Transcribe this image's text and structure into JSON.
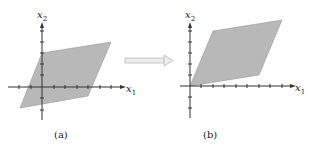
{
  "figure": {
    "arrow_color": "#c8c8c8",
    "fill_color": "#b8b8b8",
    "panels": [
      {
        "id": "a",
        "caption": "(a)",
        "x_label": "x",
        "x_sub": "1",
        "y_label": "x",
        "y_sub": "2",
        "origin": [
          42,
          87
        ],
        "polygon": "20,108 88,96 111,42 42,53"
      },
      {
        "id": "b",
        "caption": "(b)",
        "x_label": "x",
        "x_sub": "1",
        "y_label": "x",
        "y_sub": "2",
        "origin": [
          190,
          86
        ],
        "polygon": "190,86 259,75 282,20 213,31"
      }
    ]
  }
}
